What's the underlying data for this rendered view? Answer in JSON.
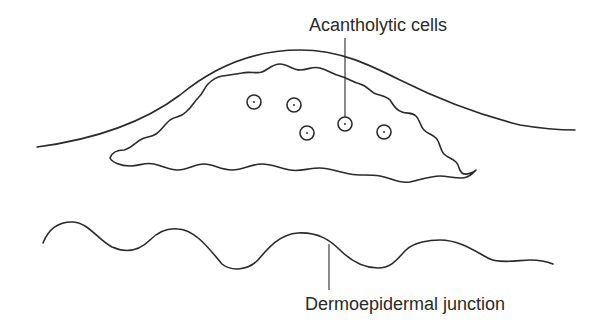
{
  "labels": {
    "acantholytic_cells": "Acantholytic cells",
    "dermoepidermal_junction": "Dermoepidermal junction"
  },
  "diagram": {
    "cell_count": 5,
    "stroke_color": "#2a2a2a",
    "background": "#ffffff"
  }
}
